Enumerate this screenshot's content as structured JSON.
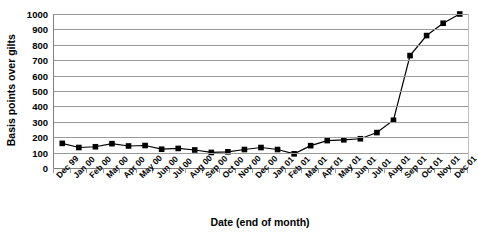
{
  "chart_data": {
    "type": "line",
    "title": "",
    "subtitle": "",
    "xlabel": "Date (end of month)",
    "ylabel": "Basis points over gilts",
    "ylim": [
      0,
      1000
    ],
    "ytick_step": 100,
    "grid": true,
    "legend": "none",
    "marker": "filled-square",
    "line_color": "#000000",
    "marker_color": "#000000",
    "grid_color": "#9a9a9a",
    "axis_color": "#808080",
    "background": "#ffffff",
    "ytick_labels": [
      "1000",
      "900",
      "800",
      "700",
      "600",
      "500",
      "400",
      "300",
      "200",
      "100",
      "0"
    ],
    "ytick_values": [
      1000,
      900,
      800,
      700,
      600,
      500,
      400,
      300,
      200,
      100,
      0
    ],
    "categories": [
      "Dec 99",
      "Jan 00",
      "Feb 00",
      "Mar 00",
      "Apr 00",
      "May 00",
      "Jun 00",
      "Jul 00",
      "Aug 00",
      "Sep 00",
      "Oct 00",
      "Nov 00",
      "Dec 00",
      "Jan 01",
      "Feb 01",
      "Mar 01",
      "Apr 01",
      "May 01",
      "Jun 01",
      "Jul 01",
      "Aug 01",
      "Sep 01",
      "Oct 01",
      "Nov 01",
      "Dec 01"
    ],
    "series": [
      {
        "name": "Basis points over gilts",
        "values": [
          160,
          133,
          138,
          158,
          143,
          146,
          122,
          127,
          117,
          101,
          105,
          120,
          133,
          120,
          92,
          145,
          178,
          183,
          190,
          230,
          310,
          730,
          860,
          940,
          1000
        ]
      }
    ]
  }
}
